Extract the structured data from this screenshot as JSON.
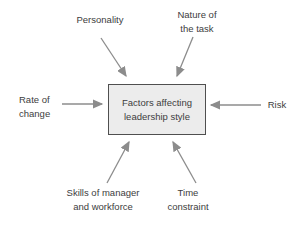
{
  "diagram": {
    "title": "Factors affecting leadership style",
    "center_box": {
      "text": "Factors affecting\nleadership style"
    },
    "labels": {
      "personality": {
        "text": "Personality"
      },
      "nature_of_task": {
        "text": "Nature of\nthe task"
      },
      "rate_of_change": {
        "text": "Rate of\nchange"
      },
      "risk": {
        "text": "Risk"
      },
      "skills": {
        "text": "Skills of manager\nand workforce"
      },
      "time_constraint": {
        "text": "Time\nconstraint"
      }
    },
    "arrows": [
      {
        "from": "personality",
        "to": "center_box"
      },
      {
        "from": "nature_of_task",
        "to": "center_box"
      },
      {
        "from": "rate_of_change",
        "to": "center_box"
      },
      {
        "from": "risk",
        "to": "center_box"
      },
      {
        "from": "skills",
        "to": "center_box"
      },
      {
        "from": "time_constraint",
        "to": "center_box"
      }
    ],
    "colors": {
      "background": "#ffffff",
      "text": "#3d3d3d",
      "arrow": "#8c8c8c",
      "box_fill": "#ececec",
      "box_border": "#4f4f4f"
    }
  }
}
